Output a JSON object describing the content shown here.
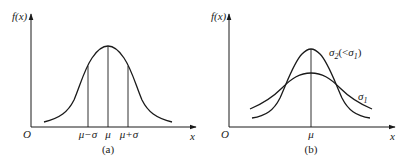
{
  "panels": [
    {
      "id": "a",
      "caption": "(a)",
      "y_axis_label": "f(x)",
      "x_axis_label": "x",
      "origin_label": "O",
      "ticks": [
        "μ−σ",
        "μ",
        "μ+σ"
      ],
      "curves": [
        {
          "name": "normal density",
          "mean": "μ",
          "sigma": "σ"
        }
      ]
    },
    {
      "id": "b",
      "caption": "(b)",
      "y_axis_label": "f(x)",
      "x_axis_label": "x",
      "origin_label": "O",
      "ticks": [
        "μ"
      ],
      "curves": [
        {
          "name": "σ2 curve",
          "label": "σ2(<σ1)",
          "label_main": "σ",
          "label_sub": "2",
          "label_rest_open": "(<",
          "label_rest_main": "σ",
          "label_rest_sub": "1",
          "label_rest_close": ")"
        },
        {
          "name": "σ1 curve",
          "label": "σ1",
          "label_main": "σ",
          "label_sub": "1"
        }
      ]
    }
  ]
}
